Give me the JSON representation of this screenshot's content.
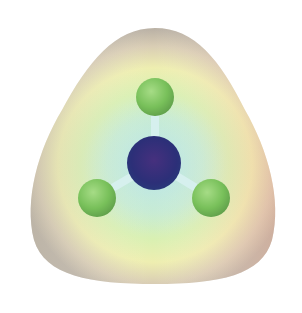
{
  "figure": {
    "atoms": [
      {
        "role": "central",
        "color": "#2f2f7a"
      },
      {
        "role": "terminal-top",
        "color": "#7cc45a"
      },
      {
        "role": "terminal-left",
        "color": "#7cc45a"
      },
      {
        "role": "terminal-right",
        "color": "#7cc45a"
      }
    ],
    "surface_colors": {
      "outer": "#c9bfb0",
      "rim_red": "#efb59c",
      "yellow": "#f2f0a8",
      "green": "#c8ecb0",
      "inner_cyan": "#bfe8e0",
      "bond": "#d8f0ee"
    }
  }
}
